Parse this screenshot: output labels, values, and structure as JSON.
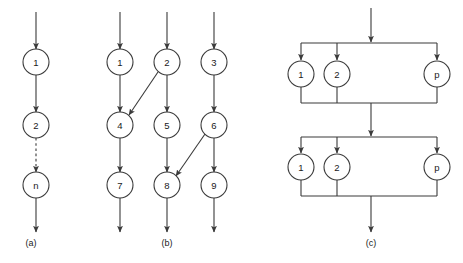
{
  "figure": {
    "width": 463,
    "height": 263,
    "background": "#ffffff",
    "stroke_color": "#3a3a3a",
    "text_color": "#1a1a1a"
  },
  "panels": [
    {
      "id": "a",
      "label": "(a)",
      "label_x": 31,
      "label_y": 243,
      "description": "serial chain of n tasks",
      "nodes": [
        {
          "name": "a-node-1",
          "text": "1",
          "cx": 36,
          "cy": 62,
          "r": 13
        },
        {
          "name": "a-node-2",
          "text": "2",
          "cx": 36,
          "cy": 125,
          "r": 13
        },
        {
          "name": "a-node-n",
          "text": "n",
          "cx": 36,
          "cy": 185,
          "r": 13
        }
      ],
      "edges": [
        {
          "name": "a-edge-in",
          "x1": 36,
          "y1": 12,
          "x2": 36,
          "y2": 49,
          "style": "solid",
          "arrow": true
        },
        {
          "name": "a-edge-1-to-2",
          "x1": 36,
          "y1": 75,
          "x2": 36,
          "y2": 112,
          "style": "solid",
          "arrow": true
        },
        {
          "name": "a-edge-2-to-n",
          "x1": 36,
          "y1": 138,
          "x2": 36,
          "y2": 172,
          "style": "dashed",
          "arrow": true
        },
        {
          "name": "a-edge-out",
          "x1": 36,
          "y1": 198,
          "x2": 36,
          "y2": 232,
          "style": "solid",
          "arrow": true
        }
      ]
    },
    {
      "id": "b",
      "label": "(b)",
      "label_x": 167,
      "label_y": 243,
      "description": "three parallel chains with cross dependencies",
      "nodes": [
        {
          "name": "b-node-1",
          "text": "1",
          "cx": 120,
          "cy": 62,
          "r": 13
        },
        {
          "name": "b-node-2",
          "text": "2",
          "cx": 167,
          "cy": 62,
          "r": 13
        },
        {
          "name": "b-node-3",
          "text": "3",
          "cx": 214,
          "cy": 62,
          "r": 13
        },
        {
          "name": "b-node-4",
          "text": "4",
          "cx": 120,
          "cy": 125,
          "r": 13
        },
        {
          "name": "b-node-5",
          "text": "5",
          "cx": 167,
          "cy": 125,
          "r": 13
        },
        {
          "name": "b-node-6",
          "text": "6",
          "cx": 214,
          "cy": 125,
          "r": 13
        },
        {
          "name": "b-node-7",
          "text": "7",
          "cx": 120,
          "cy": 185,
          "r": 13
        },
        {
          "name": "b-node-8",
          "text": "8",
          "cx": 167,
          "cy": 185,
          "r": 13
        },
        {
          "name": "b-node-9",
          "text": "9",
          "cx": 214,
          "cy": 185,
          "r": 13
        }
      ],
      "edges": [
        {
          "name": "b-edge-in-1",
          "x1": 120,
          "y1": 12,
          "x2": 120,
          "y2": 49,
          "style": "solid",
          "arrow": true
        },
        {
          "name": "b-edge-in-2",
          "x1": 167,
          "y1": 12,
          "x2": 167,
          "y2": 49,
          "style": "solid",
          "arrow": true
        },
        {
          "name": "b-edge-in-3",
          "x1": 214,
          "y1": 12,
          "x2": 214,
          "y2": 49,
          "style": "solid",
          "arrow": true
        },
        {
          "name": "b-edge-1-to-4",
          "x1": 120,
          "y1": 75,
          "x2": 120,
          "y2": 112,
          "style": "solid",
          "arrow": true
        },
        {
          "name": "b-edge-2-to-5",
          "x1": 167,
          "y1": 75,
          "x2": 167,
          "y2": 112,
          "style": "solid",
          "arrow": true
        },
        {
          "name": "b-edge-3-to-6",
          "x1": 214,
          "y1": 75,
          "x2": 214,
          "y2": 112,
          "style": "solid",
          "arrow": true
        },
        {
          "name": "b-edge-4-to-7",
          "x1": 120,
          "y1": 138,
          "x2": 120,
          "y2": 172,
          "style": "solid",
          "arrow": true
        },
        {
          "name": "b-edge-5-to-8",
          "x1": 167,
          "y1": 138,
          "x2": 167,
          "y2": 172,
          "style": "solid",
          "arrow": true
        },
        {
          "name": "b-edge-6-to-9",
          "x1": 214,
          "y1": 138,
          "x2": 214,
          "y2": 172,
          "style": "solid",
          "arrow": true
        },
        {
          "name": "b-edge-out-7",
          "x1": 120,
          "y1": 198,
          "x2": 120,
          "y2": 232,
          "style": "solid",
          "arrow": true
        },
        {
          "name": "b-edge-out-8",
          "x1": 167,
          "y1": 198,
          "x2": 167,
          "y2": 232,
          "style": "solid",
          "arrow": true
        },
        {
          "name": "b-edge-out-9",
          "x1": 214,
          "y1": 198,
          "x2": 214,
          "y2": 232,
          "style": "solid",
          "arrow": true
        },
        {
          "name": "b-edge-2-to-4-diagonal",
          "x1": 158,
          "y1": 72,
          "x2": 129,
          "y2": 115,
          "style": "solid",
          "arrow": true
        },
        {
          "name": "b-edge-6-to-8-diagonal",
          "x1": 205,
          "y1": 134,
          "x2": 176,
          "y2": 176,
          "style": "solid",
          "arrow": true
        }
      ]
    },
    {
      "id": "c",
      "label": "(c)",
      "label_x": 371,
      "label_y": 243,
      "description": "two sequential fork-join blocks each with p parallel tasks",
      "blocks": [
        {
          "name": "c-block-top",
          "fork_bar_y": 43,
          "join_bar_y": 103,
          "bar_x1": 301,
          "bar_x2": 437,
          "nodes": [
            {
              "name": "c-top-node-1",
              "text": "1",
              "cx": 301,
              "cy": 74,
              "r": 13
            },
            {
              "name": "c-top-node-2",
              "text": "2",
              "cx": 337,
              "cy": 74,
              "r": 13
            },
            {
              "name": "c-top-node-p",
              "text": "p",
              "cx": 437,
              "cy": 74,
              "r": 13
            }
          ]
        },
        {
          "name": "c-block-bottom",
          "fork_bar_y": 137,
          "join_bar_y": 196,
          "bar_x1": 301,
          "bar_x2": 437,
          "nodes": [
            {
              "name": "c-bottom-node-1",
              "text": "1",
              "cx": 301,
              "cy": 167,
              "r": 13
            },
            {
              "name": "c-bottom-node-2",
              "text": "2",
              "cx": 337,
              "cy": 167,
              "r": 13
            },
            {
              "name": "c-bottom-node-p",
              "text": "p",
              "cx": 437,
              "cy": 167,
              "r": 13
            }
          ]
        }
      ],
      "center_x": 371,
      "edges": [
        {
          "name": "c-edge-input",
          "x1": 371,
          "y1": 8,
          "x2": 371,
          "y2": 42,
          "style": "solid",
          "arrow": true
        },
        {
          "name": "c-edge-between-blocks",
          "x1": 371,
          "y1": 103,
          "x2": 371,
          "y2": 136,
          "style": "solid",
          "arrow": true
        },
        {
          "name": "c-edge-output",
          "x1": 371,
          "y1": 196,
          "x2": 371,
          "y2": 232,
          "style": "solid",
          "arrow": true
        }
      ]
    }
  ]
}
